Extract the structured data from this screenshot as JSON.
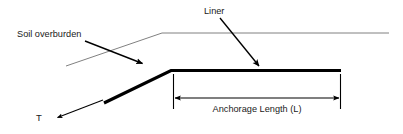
{
  "diagram": {
    "title_labels": {
      "liner": "Liner",
      "soil_overburden": "Soil overburden",
      "tension": "T",
      "anchorage_length": "Anchorage Length (L)"
    },
    "colors": {
      "liner_stroke": "#000000",
      "soil_stroke": "#555555",
      "arrow_stroke": "#000000",
      "dimension_stroke": "#000000",
      "text": "#1a1a1a",
      "background": "#ffffff"
    },
    "geometry": {
      "liner_thickness_px": 3,
      "soil_thickness_px": 0.7,
      "liner_bend_point": [
        171,
        70
      ],
      "liner_sloped_start": [
        104,
        103
      ],
      "liner_flat_end": [
        341,
        70
      ],
      "soil_slope_start": [
        66,
        66
      ],
      "soil_bend_point": [
        162,
        33
      ],
      "soil_flat_end": [
        389,
        33
      ],
      "anchorage_extent_x": [
        173,
        341
      ],
      "dimension_line_y": 98
    },
    "annotations": [
      {
        "name": "liner-leader",
        "from": [
          220,
          18
        ],
        "to": [
          259,
          67
        ]
      },
      {
        "name": "soil-overburden-leader",
        "from": [
          85,
          41
        ],
        "to": [
          143,
          64
        ]
      },
      {
        "name": "tension-arrow",
        "from": [
          103,
          100
        ],
        "to": [
          57,
          118
        ]
      }
    ]
  }
}
